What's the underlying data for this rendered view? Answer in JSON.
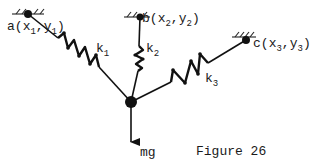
{
  "figure": {
    "caption": "Figure 26",
    "weight_label": "mg"
  },
  "anchors": [
    {
      "id": "a",
      "letter": "a",
      "x_label": "x",
      "x_sub": "1",
      "y_label": "y",
      "y_sub": "1"
    },
    {
      "id": "b",
      "letter": "b",
      "x_label": "x",
      "x_sub": "2",
      "y_label": "y",
      "y_sub": "2"
    },
    {
      "id": "c",
      "letter": "c",
      "x_label": "x",
      "x_sub": "3",
      "y_label": "y",
      "y_sub": "3"
    }
  ],
  "springs": [
    {
      "id": "k1",
      "letter": "k",
      "sub": "1"
    },
    {
      "id": "k2",
      "letter": "k",
      "sub": "2"
    },
    {
      "id": "k3",
      "letter": "k",
      "sub": "3"
    }
  ],
  "colors": {
    "ink": "#111111",
    "background": "#ffffff"
  }
}
